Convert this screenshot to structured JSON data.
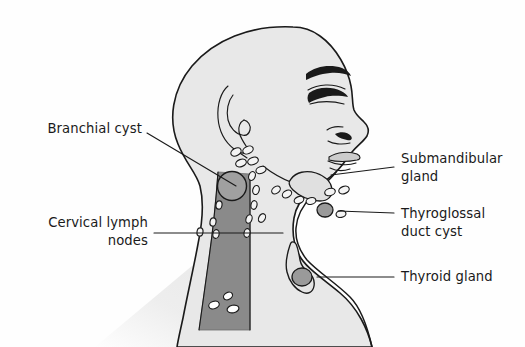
{
  "figure": {
    "background_color": "#fefefe",
    "ink_color": "#1a1a1a",
    "skin_fill": "#e8e8e8",
    "muscle_fill": "#8a8a8a",
    "lesion_fill": "#a0a0a0",
    "node_fill": "#f4f4f4"
  },
  "labels": [
    {
      "id": "branchial-cyst",
      "text": "Branchial cyst",
      "side": "left",
      "text_x": 142,
      "text_y": 133,
      "leader": "M147,133 L236,186"
    },
    {
      "id": "cervical-lymph-nodes",
      "text_line1": "Cervical lymph",
      "text_line2": "nodes",
      "side": "left",
      "text_x": 148,
      "text_y": 227,
      "text_y2": 245,
      "leader": "M154,233 L283,233"
    },
    {
      "id": "submandibular-gland",
      "text_line1": "Submandibular",
      "text_line2": "gland",
      "side": "right",
      "text_x": 401,
      "text_y": 163,
      "text_y2": 181,
      "leader": "M394,167 L331,175"
    },
    {
      "id": "thyroglossal-duct-cyst",
      "text_line1": "Thyroglossal",
      "text_line2": "duct cyst",
      "side": "right",
      "text_x": 401,
      "text_y": 218,
      "text_y2": 236,
      "leader": "M394,213 L338,211"
    },
    {
      "id": "thyroid-gland",
      "text": "Thyroid gland",
      "side": "right",
      "text_x": 401,
      "text_y": 281,
      "leader": "M394,277 L317,277"
    }
  ],
  "structures": [
    {
      "id": "head",
      "name": "head-profile"
    },
    {
      "id": "ear",
      "name": "ear"
    },
    {
      "id": "eyebrow",
      "name": "eyebrow"
    },
    {
      "id": "eye",
      "name": "eye"
    },
    {
      "id": "nose",
      "name": "nose"
    },
    {
      "id": "lips",
      "name": "lips"
    },
    {
      "id": "sternocleidomastoid",
      "name": "sternocleidomastoid-muscle"
    },
    {
      "id": "branchial-cyst-shape",
      "name": "branchial-cyst"
    },
    {
      "id": "submandibular-gland-shape",
      "name": "submandibular-gland"
    },
    {
      "id": "thyroglossal-cyst-shape",
      "name": "thyroglossal-duct-cyst"
    },
    {
      "id": "thyroid-shape",
      "name": "thyroid-gland"
    },
    {
      "id": "lymph-nodes",
      "name": "cervical-lymph-nodes",
      "count": 26
    }
  ]
}
